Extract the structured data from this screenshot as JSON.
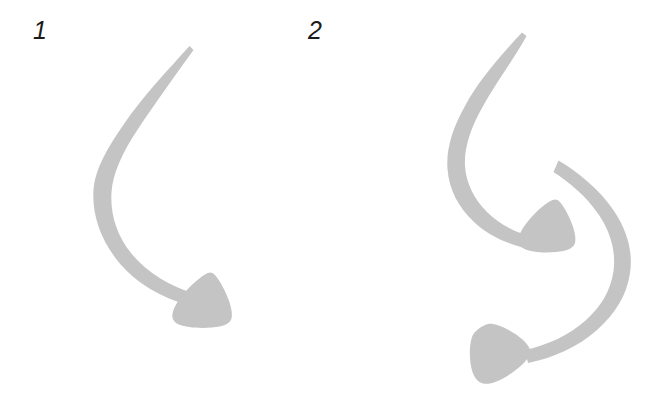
{
  "figure": {
    "type": "line-drawing",
    "background_color": "#ffffff",
    "stroke_color": "#c3c4c3",
    "label_color": "#1b1b1b",
    "width": 655,
    "height": 405
  },
  "panels": [
    {
      "id": "panel-1",
      "label": "1",
      "label_x": 33,
      "label_y": 18,
      "arrow_count": 1,
      "arrows": [
        {
          "name": "arrow-1-main",
          "shape": "single-c-curve",
          "tail_point": [
            188,
            47
          ],
          "head_point": [
            205,
            300
          ],
          "head_direction": "right-down",
          "stroke_color": "#c3c4c3"
        }
      ]
    },
    {
      "id": "panel-2",
      "label": "2",
      "label_x": 308,
      "label_y": 18,
      "arrow_count": 2,
      "arrows": [
        {
          "name": "arrow-2-upper",
          "shape": "single-c-curve",
          "tail_point": [
            521,
            33
          ],
          "head_point": [
            556,
            226
          ],
          "head_direction": "right-down",
          "stroke_color": "#c3c4c3"
        },
        {
          "name": "arrow-2-lower",
          "shape": "single-c-curve",
          "tail_point": [
            558,
            160
          ],
          "head_point": [
            483,
            352
          ],
          "head_direction": "left-down",
          "stroke_color": "#c3c4c3"
        }
      ]
    }
  ],
  "icons": {
    "arrow_head": "arrowhead-cone-icon",
    "arrow_tail": "arrow-tail-taper-icon"
  }
}
